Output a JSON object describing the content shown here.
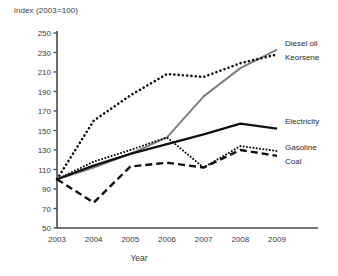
{
  "chart_data": {
    "type": "line",
    "title": "",
    "ylabel": "index (2003=100)",
    "xlabel": "Year",
    "x": [
      2003,
      2004,
      2005,
      2006,
      2007,
      2008,
      2009
    ],
    "xtick_labels": [
      "2003",
      "2004",
      "2005",
      "2006",
      "2007",
      "2008",
      "2009"
    ],
    "ytick_labels": [
      "250",
      "230",
      "210",
      "190",
      "170",
      "150",
      "130",
      "110",
      "90",
      "70",
      "50"
    ],
    "ytick_values": [
      250,
      230,
      210,
      190,
      170,
      150,
      130,
      110,
      90,
      70,
      50
    ],
    "ylim": [
      50,
      250
    ],
    "xlim": [
      2003,
      2009
    ],
    "grid": false,
    "legend_position": "right-inline",
    "series": [
      {
        "name": "Diesel oil",
        "style": "solid",
        "color": "#808080",
        "width": 2.0,
        "values": [
          100,
          112,
          126,
          143,
          185,
          214,
          233
        ],
        "label_y": 46
      },
      {
        "name": "Keorsene",
        "style": "dotted-coarse",
        "color": "#111111",
        "width": 2.6,
        "values": [
          100,
          160,
          186,
          208,
          205,
          219,
          228
        ],
        "label_y": 60
      },
      {
        "name": "Electricity",
        "style": "solid",
        "color": "#111111",
        "width": 2.2,
        "values": [
          100,
          114,
          126,
          136,
          146,
          157,
          152
        ],
        "label_y": 124
      },
      {
        "name": "Gasoline",
        "style": "dotted-fine",
        "color": "#111111",
        "width": 2.0,
        "values": [
          100,
          118,
          130,
          143,
          112,
          134,
          129
        ],
        "label_y": 150
      },
      {
        "name": "Coal",
        "style": "dashed",
        "color": "#111111",
        "width": 2.4,
        "values": [
          100,
          76,
          113,
          117,
          112,
          130,
          124
        ],
        "label_y": 164
      }
    ]
  }
}
